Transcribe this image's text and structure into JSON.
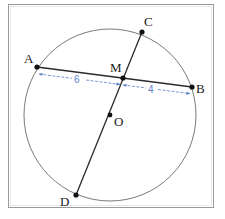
{
  "diagram": {
    "type": "circle-intersecting-chords",
    "frame": {
      "x": 8,
      "y": 4,
      "width": 206,
      "height": 204,
      "stroke": "#9a9a9a"
    },
    "circle": {
      "center_label": "O",
      "cx": 110,
      "cy": 115,
      "r": 86,
      "stroke": "#6a6a6a"
    },
    "points": {
      "A": {
        "label": "A",
        "x": 37,
        "y": 67
      },
      "B": {
        "label": "B",
        "x": 192,
        "y": 87
      },
      "C": {
        "label": "C",
        "x": 142,
        "y": 32
      },
      "D": {
        "label": "D",
        "x": 76,
        "y": 195
      },
      "M": {
        "label": "M",
        "x": 123,
        "y": 78
      },
      "O": {
        "label": "O",
        "x": 110,
        "y": 115
      }
    },
    "segments": [
      {
        "from": "A",
        "to": "B",
        "name": "chord-AB"
      },
      {
        "from": "C",
        "to": "D",
        "name": "chord-CD"
      }
    ],
    "dimensions": [
      {
        "name": "AM",
        "label": "6",
        "from": "A",
        "to": "M"
      },
      {
        "name": "MB",
        "label": "4",
        "from": "M",
        "to": "B"
      }
    ],
    "colors": {
      "line": "#2a2a2a",
      "point": "#111111",
      "dimension": "#5b7fc9",
      "circle": "#6a6a6a",
      "frame": "#9a9a9a"
    }
  }
}
